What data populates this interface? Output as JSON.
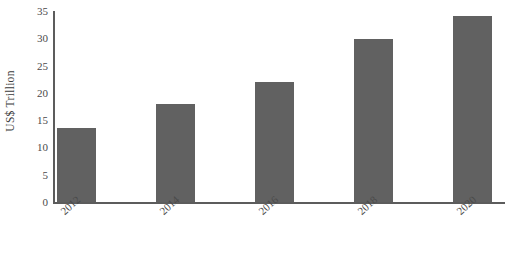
{
  "chart_data": {
    "type": "bar",
    "title": "",
    "subtitle": "",
    "xlabel": "",
    "ylabel": "US$ Trillion",
    "categories": [
      "2012",
      "2014",
      "2016",
      "2018",
      "2020"
    ],
    "values": [
      13.5,
      18.0,
      22.0,
      29.8,
      34.0
    ],
    "series": [
      {
        "name": "US$ Trillion",
        "values": [
          13.5,
          18.0,
          22.0,
          29.8,
          34.0
        ]
      }
    ],
    "ylim": [
      0,
      35
    ],
    "xlim": [],
    "yticks": [
      "0",
      "5",
      "10",
      "15",
      "20",
      "25",
      "30",
      "35"
    ],
    "ytick_values": [
      0,
      5,
      10,
      15,
      20,
      25,
      30,
      35
    ],
    "grid": false,
    "legend": false,
    "legend_position": "none",
    "annotations": [],
    "bar_color": "#616161",
    "axis_color": "#5c5c5c",
    "background_color": "#ffffff",
    "xtick_rotation_degrees": 42
  }
}
